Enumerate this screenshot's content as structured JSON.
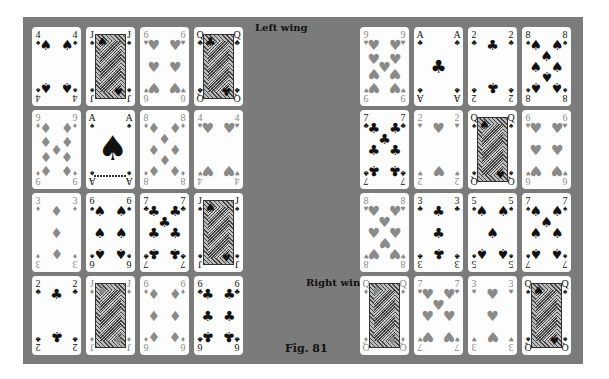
{
  "figure": {
    "caption": "Fig. 81",
    "labels": {
      "left_wing": "Left wing",
      "right_wing": "Right wing"
    },
    "colors": {
      "panel": "#7b7b7b",
      "card": "#fdfdfd",
      "red_suit_print": "#8a8a8a",
      "black_suit": "#111111"
    }
  },
  "left_wing": {
    "rows": [
      [
        {
          "rank": "4",
          "suit": "spades"
        },
        {
          "rank": "J",
          "suit": "spades"
        },
        {
          "rank": "6",
          "suit": "hearts"
        },
        {
          "rank": "Q",
          "suit": "clubs"
        }
      ],
      [
        {
          "rank": "9",
          "suit": "diamonds"
        },
        {
          "rank": "A",
          "suit": "spades"
        },
        {
          "rank": "8",
          "suit": "diamonds"
        },
        {
          "rank": "4",
          "suit": "hearts"
        }
      ],
      [
        {
          "rank": "3",
          "suit": "diamonds"
        },
        {
          "rank": "6",
          "suit": "spades"
        },
        {
          "rank": "7",
          "suit": "clubs"
        },
        {
          "rank": "J",
          "suit": "spades"
        }
      ],
      [
        {
          "rank": "2",
          "suit": "clubs"
        },
        {
          "rank": "J",
          "suit": "diamonds"
        },
        {
          "rank": "6",
          "suit": "diamonds"
        },
        {
          "rank": "6",
          "suit": "clubs"
        }
      ]
    ]
  },
  "right_wing": {
    "rows": [
      [
        {
          "rank": "9",
          "suit": "hearts"
        },
        {
          "rank": "A",
          "suit": "clubs"
        },
        {
          "rank": "2",
          "suit": "clubs"
        },
        {
          "rank": "8",
          "suit": "spades"
        }
      ],
      [
        {
          "rank": "7",
          "suit": "clubs"
        },
        {
          "rank": "2",
          "suit": "hearts"
        },
        {
          "rank": "Q",
          "suit": "spades"
        },
        {
          "rank": "6",
          "suit": "hearts"
        }
      ],
      [
        {
          "rank": "8",
          "suit": "hearts"
        },
        {
          "rank": "3",
          "suit": "clubs"
        },
        {
          "rank": "5",
          "suit": "spades"
        },
        {
          "rank": "7",
          "suit": "spades"
        }
      ],
      [
        {
          "rank": "Q",
          "suit": "diamonds"
        },
        {
          "rank": "7",
          "suit": "hearts"
        },
        {
          "rank": "3",
          "suit": "hearts"
        },
        {
          "rank": "Q",
          "suit": "spades"
        }
      ]
    ]
  },
  "suit_glyphs": {
    "spades": "♠",
    "hearts": "♥",
    "diamonds": "♦",
    "clubs": "♣"
  }
}
